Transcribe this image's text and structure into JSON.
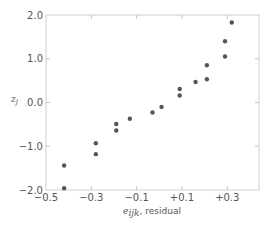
{
  "chart_data": {
    "type": "scatter",
    "title": "",
    "xlabel": "e_ijk, residual",
    "xlabel_var": "e",
    "xlabel_sub": "ijk",
    "xlabel_suffix": ", residual",
    "ylabel": "z_j",
    "ylabel_var": "z",
    "ylabel_sub": "j",
    "xlim": [
      -0.5,
      0.44
    ],
    "ylim": [
      -2.0,
      2.0
    ],
    "xticks": [
      -0.5,
      -0.3,
      -0.1,
      0.1,
      0.3
    ],
    "xtick_labels": [
      "−0.5",
      "−0.3",
      "−0.1",
      "+0.1",
      "+0.3"
    ],
    "yticks": [
      2.0,
      1.0,
      0.0,
      -1.0,
      -2.0
    ],
    "ytick_labels": [
      "2.0",
      "1.0",
      "0.0",
      "−1.0",
      "−2.0"
    ],
    "grid": false,
    "legend": null,
    "point_color": "#555555",
    "series": [
      {
        "name": "normal probability plot of residuals",
        "points": [
          {
            "x": -0.42,
            "y": -1.96
          },
          {
            "x": -0.42,
            "y": -1.44
          },
          {
            "x": -0.28,
            "y": -1.18
          },
          {
            "x": -0.28,
            "y": -0.93
          },
          {
            "x": -0.19,
            "y": -0.64
          },
          {
            "x": -0.19,
            "y": -0.49
          },
          {
            "x": -0.13,
            "y": -0.37
          },
          {
            "x": -0.03,
            "y": -0.23
          },
          {
            "x": 0.01,
            "y": -0.1
          },
          {
            "x": 0.09,
            "y": 0.16
          },
          {
            "x": 0.09,
            "y": 0.31
          },
          {
            "x": 0.16,
            "y": 0.47
          },
          {
            "x": 0.21,
            "y": 0.53
          },
          {
            "x": 0.21,
            "y": 0.85
          },
          {
            "x": 0.29,
            "y": 1.05
          },
          {
            "x": 0.29,
            "y": 1.4
          },
          {
            "x": 0.32,
            "y": 1.83
          }
        ]
      }
    ]
  }
}
